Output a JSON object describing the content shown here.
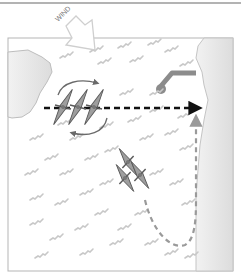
{
  "diagram": {
    "wind_label": "WIND",
    "colors": {
      "frame": "#9a9a9a",
      "water": "#ffffff",
      "ripple": "#c8c8c8",
      "land": "#e6e6e6",
      "land_edge": "#bdbdbd",
      "kayak_fill": "#9e9e9e",
      "kayak_edge": "#5a5a5a",
      "course_line": "#111111",
      "return_line": "#9a9a9a",
      "rotate_arrow": "#6a6a6a",
      "wind_arrow_fill": "#ffffff",
      "wind_arrow_edge": "#cfcfcf",
      "groyne": "#8c8c8c"
    },
    "elements": {
      "wind_arrow": "wind-direction-arrow",
      "course": "dashed straight course to far shore",
      "return_route": "dashed gray return loop",
      "kayak_group_upwind": 3,
      "kayak_group_downwind": 3
    }
  }
}
